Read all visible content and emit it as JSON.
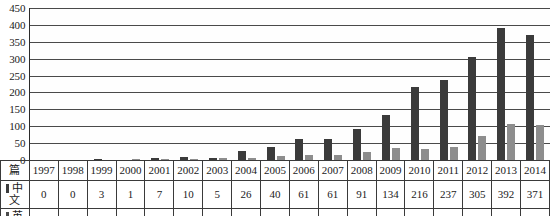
{
  "chart_data": {
    "type": "bar",
    "title": "",
    "xlabel": "",
    "ylabel": "",
    "unit_label": "篇",
    "ylim": [
      0,
      450
    ],
    "ytick_step": 50,
    "yticks": [
      450,
      400,
      350,
      300,
      250,
      200,
      150,
      100,
      50,
      0
    ],
    "grid": true,
    "legend_position": "table-row-heads",
    "categories": [
      "1997",
      "1998",
      "1999",
      "2000",
      "2001",
      "2002",
      "2003",
      "2004",
      "2005",
      "2006",
      "2007",
      "2008",
      "2009",
      "2010",
      "2011",
      "2012",
      "2013",
      "2014"
    ],
    "series": [
      {
        "name": "中文",
        "color": "#3b3b3b",
        "values": [
          0,
          0,
          3,
          1,
          7,
          10,
          5,
          26,
          40,
          61,
          61,
          91,
          134,
          216,
          237,
          305,
          392,
          371
        ]
      },
      {
        "name": "英文",
        "color": "#8d8d8d",
        "values": [
          1,
          0,
          1,
          4,
          4,
          4,
          7,
          6,
          11,
          16,
          15,
          23,
          35,
          34,
          38,
          71,
          107,
          105
        ]
      }
    ]
  },
  "table": {
    "corner_label": "篇",
    "row_labels": [
      "中文",
      "英文"
    ]
  }
}
